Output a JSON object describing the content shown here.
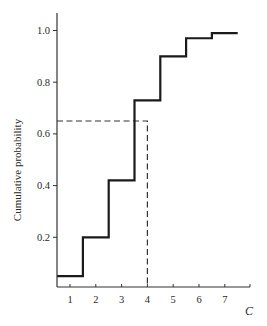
{
  "chart_data": {
    "type": "line",
    "subtype": "step-cdf",
    "title": "",
    "xlabel": "C",
    "ylabel": "Cumulative probability",
    "xlim": [
      0.5,
      8.0
    ],
    "ylim": [
      0.0,
      1.05
    ],
    "grid": false,
    "legend": null,
    "x_ticks": [
      1,
      2,
      3,
      4,
      5,
      6,
      7
    ],
    "y_ticks": [
      0.2,
      0.4,
      0.6,
      0.8,
      1.0
    ],
    "y_tick_labels": [
      "0.2",
      "0.4",
      "0.6",
      "0.8",
      "1.0"
    ],
    "x_tick_labels": [
      "1",
      "2",
      "3",
      "4",
      "5",
      "6",
      "7"
    ],
    "series": [
      {
        "name": "empirical CDF",
        "style": "solid-step",
        "color": "#1a1a1a",
        "steps": [
          {
            "x_start": 0.5,
            "x_end": 1.5,
            "y": 0.05
          },
          {
            "x_start": 1.5,
            "x_end": 2.5,
            "y": 0.2
          },
          {
            "x_start": 2.5,
            "x_end": 3.5,
            "y": 0.42
          },
          {
            "x_start": 3.5,
            "x_end": 4.5,
            "y": 0.73
          },
          {
            "x_start": 4.5,
            "x_end": 5.5,
            "y": 0.9
          },
          {
            "x_start": 5.5,
            "x_end": 6.5,
            "y": 0.97
          },
          {
            "x_start": 6.5,
            "x_end": 7.5,
            "y": 0.99
          }
        ]
      }
    ],
    "annotations": [
      {
        "type": "dashed-guide",
        "description": "reads cumulative probability at C = 4",
        "x": 4.0,
        "y": 0.65,
        "color": "#333333"
      }
    ]
  }
}
